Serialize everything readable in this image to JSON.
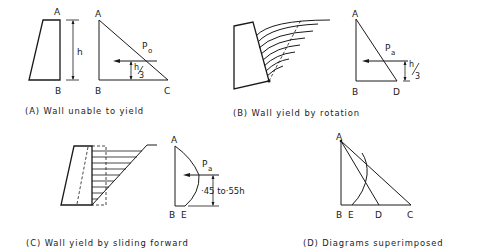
{
  "figure": {
    "panels": [
      {
        "id": "A",
        "caption": "(A) Wall unable to yield",
        "labels": {
          "top": "A",
          "wall_base": "B",
          "tri_top": "A",
          "tri_base_left": "B",
          "tri_base_right": "C",
          "height": "h",
          "force": "P",
          "force_sub": "o",
          "arm_num": "h",
          "arm_den": "3"
        }
      },
      {
        "id": "B",
        "caption": "(B) Wall yield by rotation",
        "labels": {
          "tri_top": "A",
          "tri_base_left": "B",
          "tri_base_right": "D",
          "force": "P",
          "force_sub": "a",
          "arm_num": "h",
          "arm_den": "3"
        }
      },
      {
        "id": "C",
        "caption": "(C) Wall yield by sliding forward",
        "labels": {
          "tri_top": "A",
          "tri_base_left": "B",
          "tri_base_right": "E",
          "force": "P",
          "force_sub": "a",
          "arm": "·45 to·55h"
        }
      },
      {
        "id": "D",
        "caption": "(D) Diagrams superimposed",
        "labels": {
          "top": "A",
          "b": "B",
          "e": "E",
          "d": "D",
          "c": "C"
        }
      }
    ]
  }
}
